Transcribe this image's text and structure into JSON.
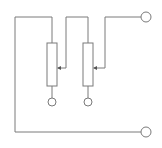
{
  "diagram": {
    "type": "circuit-schematic",
    "colors": {
      "line": "#7a7a7a",
      "background": "#ffffff"
    },
    "components": [
      {
        "id": "R1",
        "kind": "variable-resistor"
      },
      {
        "id": "R2",
        "kind": "variable-resistor"
      }
    ],
    "terminals": [
      {
        "id": "T-top-right"
      },
      {
        "id": "T-bottom-right"
      },
      {
        "id": "T-R1-bottom"
      },
      {
        "id": "T-R2-bottom"
      }
    ]
  }
}
